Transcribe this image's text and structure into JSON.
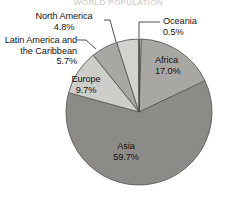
{
  "chart_data": {
    "type": "pie",
    "title": "World Population",
    "categories": [
      "Oceania",
      "Africa",
      "Asia",
      "Europe",
      "Latin America and the Caribbean",
      "North America"
    ],
    "values": [
      0.5,
      17.0,
      59.7,
      9.7,
      5.7,
      4.8
    ],
    "value_labels": [
      "0.5%",
      "17.0%",
      "59.7%",
      "9.7%",
      "5.7%",
      "4.8%"
    ],
    "unit": "percent",
    "start_angle_deg": 0,
    "direction": "clockwise",
    "legend": "none",
    "grid": false,
    "slice_colors": [
      "#d8d6d3",
      "#a9a7a4",
      "#8d8b88",
      "#cfcdca",
      "#a9a7a4",
      "#d4d2cf"
    ],
    "stroke_color": "#5d5b58",
    "background": "#ffffff"
  },
  "labels": {
    "north_america": {
      "name": "North America",
      "pct": "4.8%"
    },
    "latin_america": {
      "name_line1": "Latin America and",
      "name_line2": "the Caribbean",
      "pct": "5.7%"
    },
    "europe": {
      "name": "Europe",
      "pct": "9.7%"
    },
    "oceania": {
      "name": "Oceania",
      "pct": "0.5%"
    },
    "africa": {
      "name": "Africa",
      "pct": "17.0%"
    },
    "asia": {
      "name": "Asia",
      "pct": "59.7%"
    }
  },
  "header": {
    "clipped_title": "WORLD POPULATION"
  }
}
